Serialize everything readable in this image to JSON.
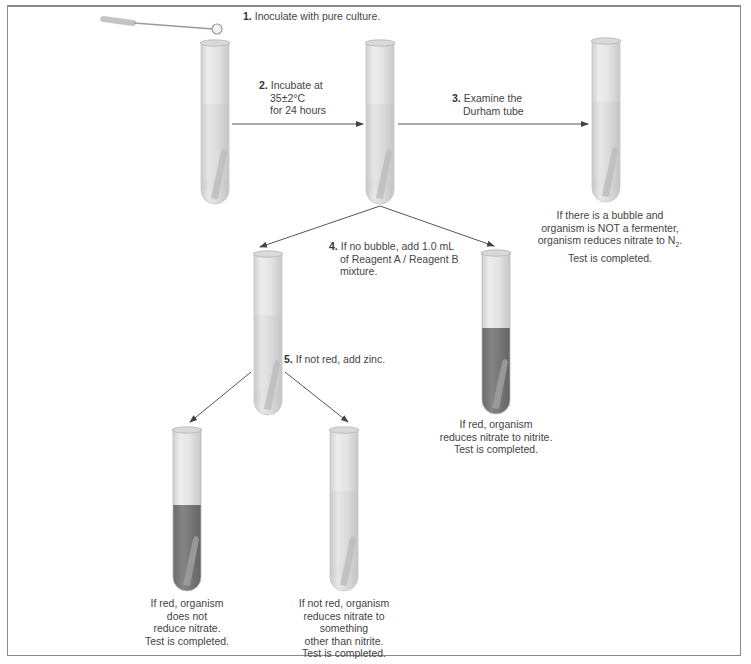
{
  "figure": {
    "type": "flowchart"
  },
  "steps": [
    {
      "number": "1.",
      "text": "Inoculate with pure culture."
    },
    {
      "number": "2.",
      "lines": [
        "Incubate at",
        "35±2°C",
        "for 24 hours"
      ]
    },
    {
      "number": "3.",
      "lines": [
        "Examine the",
        "Durham tube"
      ]
    },
    {
      "number": "4.",
      "lines": [
        "If no bubble, add 1.0 mL",
        "of Reagent A / Reagent B",
        "mixture."
      ]
    },
    {
      "number": "5.",
      "text": "If not red, add zinc."
    }
  ],
  "outcomes": {
    "n2": {
      "lines": [
        "If there is a bubble and",
        "organism is NOT a fermenter,",
        "organism reduces nitrate to N",
        "Test is completed."
      ],
      "subscript": "2",
      "suffix": "."
    },
    "nitrite": {
      "lines": [
        "If red, organism",
        "reduces nitrate to nitrite.",
        "Test is completed."
      ]
    },
    "no_reduction": {
      "lines": [
        "If red, organism",
        "does not",
        "reduce nitrate.",
        "Test is completed."
      ]
    },
    "other": {
      "lines": [
        "If not red, organism",
        "reduces nitrate to",
        "something",
        "other than nitrite.",
        "Test is completed."
      ]
    }
  },
  "colors": {
    "tube_glass": "#e6e6e6",
    "tube_edge": "#bdbdbd",
    "medium": "#d8d8d8",
    "red_medium": "#7a7a7a",
    "arrow": "#555555",
    "border": "#8a8a8a"
  }
}
